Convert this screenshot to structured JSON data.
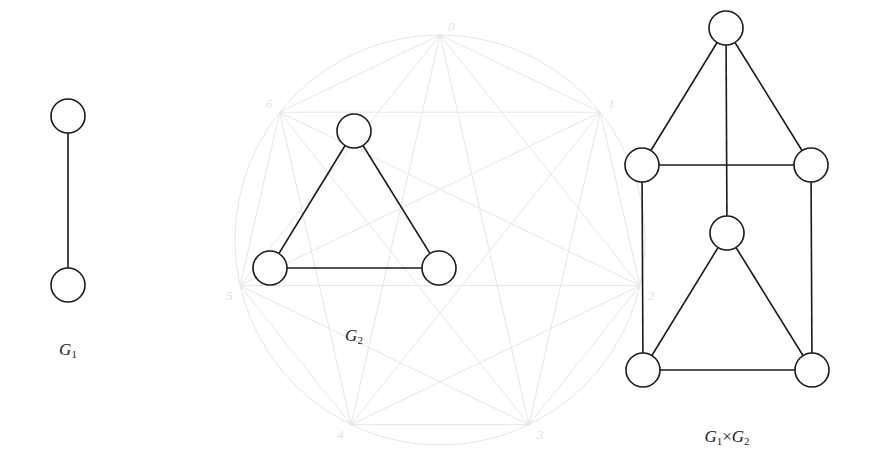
{
  "colors": {
    "stroke": "#1a1a1a",
    "node_fill": "#ffffff",
    "ghost": "#e6e6e6"
  },
  "node_radius": 17,
  "graphs": [
    {
      "id": "g1",
      "label": {
        "base": "G",
        "sub": "1",
        "x": 68,
        "y": 340
      },
      "nodes": [
        {
          "x": 68,
          "y": 116
        },
        {
          "x": 68,
          "y": 285
        }
      ],
      "edges": [
        [
          0,
          1
        ]
      ]
    },
    {
      "id": "g2",
      "label": {
        "base": "G",
        "sub": "2",
        "x": 354,
        "y": 326
      },
      "nodes": [
        {
          "x": 354,
          "y": 131
        },
        {
          "x": 270,
          "y": 268
        },
        {
          "x": 439,
          "y": 268
        }
      ],
      "edges": [
        [
          0,
          1
        ],
        [
          0,
          2
        ],
        [
          1,
          2
        ]
      ]
    },
    {
      "id": "product",
      "label": {
        "base": "G",
        "sub": "1",
        "times": "×",
        "base2": "G",
        "sub2": "2",
        "x": 727,
        "y": 427
      },
      "nodes": [
        {
          "x": 726,
          "y": 28
        },
        {
          "x": 642,
          "y": 165
        },
        {
          "x": 811,
          "y": 165
        },
        {
          "x": 727,
          "y": 233
        },
        {
          "x": 643,
          "y": 370
        },
        {
          "x": 812,
          "y": 370
        }
      ],
      "edges": [
        [
          0,
          1
        ],
        [
          0,
          2
        ],
        [
          1,
          2
        ],
        [
          0,
          3
        ],
        [
          3,
          4
        ],
        [
          3,
          5
        ],
        [
          4,
          5
        ],
        [
          1,
          4
        ],
        [
          2,
          5
        ]
      ]
    }
  ],
  "ghost_figure": {
    "cx": 440,
    "cy": 240,
    "r": 205,
    "sides": 7,
    "labels": [
      "0",
      "1",
      "2",
      "3",
      "4",
      "5",
      "6"
    ]
  }
}
